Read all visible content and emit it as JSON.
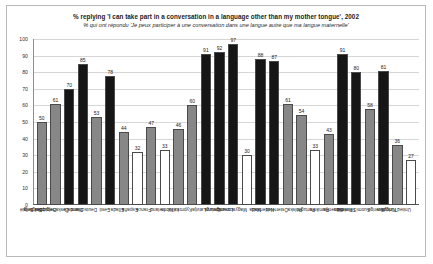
{
  "chart_data": {
    "type": "bar",
    "title": "% replying 'I can take part in a conversation in a language other than my mother tongue', 2002",
    "subtitle": "% qui ont répondu 'Je peux participer à une conversation dans une langue autre que ma langue maternelle'",
    "xlabel": "",
    "ylabel": "",
    "ylim": [
      0,
      100
    ],
    "ytick_step": 10,
    "yticks": [
      0,
      10,
      20,
      30,
      40,
      50,
      60,
      70,
      80,
      90,
      100
    ],
    "grid": true,
    "legend": "none",
    "categories": [
      "Balgarija",
      "Belgique / België",
      "Česká republika",
      "Danmark",
      "Deutschland",
      "Eesti",
      "Ellada",
      "España",
      "France",
      "Ireland",
      "Italia",
      "Kypros / Kibris",
      "Latvija",
      "Lietuva",
      "Luxembourg",
      "Magyarország",
      "Malta",
      "Nederland",
      "Österreich",
      "Polska",
      "Portugal",
      "România",
      "Slovenija",
      "Slovensko",
      "Suomi / Finland",
      "Sverige",
      "Türkiye",
      "United Kingdom"
    ],
    "values": [
      50,
      61,
      70,
      85,
      53,
      78,
      44,
      32,
      47,
      33,
      46,
      60,
      91,
      92,
      97,
      30,
      88,
      87,
      61,
      54,
      33,
      43,
      91,
      80,
      58,
      81,
      36,
      27
    ],
    "bar_styles": [
      "gray",
      "gray",
      "dark",
      "dark",
      "gray",
      "dark",
      "gray",
      "white",
      "gray",
      "white",
      "gray",
      "gray",
      "dark",
      "dark",
      "dark",
      "white",
      "dark",
      "dark",
      "gray",
      "gray",
      "white",
      "gray",
      "dark",
      "dark",
      "gray",
      "dark",
      "gray",
      "white"
    ],
    "colors": {
      "gray": "#878787",
      "dark": "#161616",
      "white": "#ffffff",
      "bar_border": "#4a4a4a",
      "gridline": "#d6d6d6",
      "axis": "#5a5a5a",
      "frame": "#b9b9b9"
    }
  }
}
